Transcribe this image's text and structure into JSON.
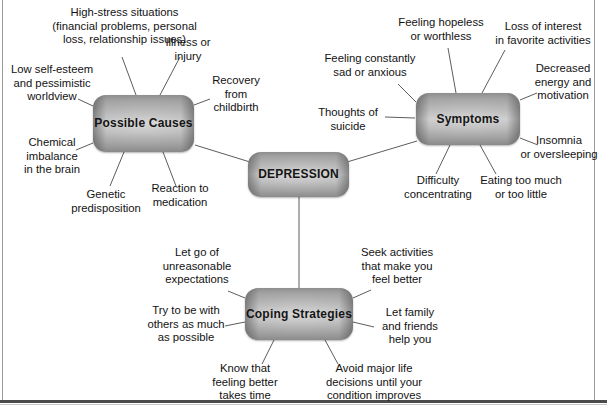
{
  "diagram": {
    "title": "DEPRESSION",
    "type": "mind-map",
    "center": {
      "id": "depression",
      "label": "DEPRESSION"
    },
    "branches": [
      {
        "id": "possible-causes",
        "label": "Possible\nCauses",
        "leaves": [
          {
            "id": "high-stress-situations",
            "text": "High-stress situations\n(financial problems, personal\nloss, relationship issues)"
          },
          {
            "id": "illness-or-injury",
            "text": "Illness or\ninjury"
          },
          {
            "id": "recovery-from-childbirth",
            "text": "Recovery\nfrom\nchildbirth"
          },
          {
            "id": "low-self-esteem",
            "text": "Low self-esteem\nand pessimistic\nworldview"
          },
          {
            "id": "chemical-imbalance",
            "text": "Chemical\nimbalance\nin the brain"
          },
          {
            "id": "genetic-predisposition",
            "text": "Genetic\npredisposition"
          },
          {
            "id": "reaction-to-medication",
            "text": "Reaction to\nmedication"
          }
        ]
      },
      {
        "id": "symptoms",
        "label": "Symptoms",
        "leaves": [
          {
            "id": "feeling-hopeless",
            "text": "Feeling hopeless\nor worthless"
          },
          {
            "id": "loss-of-interest",
            "text": "Loss of interest\nin favorite activities"
          },
          {
            "id": "feeling-sad-anxious",
            "text": "Feeling constantly\nsad or anxious"
          },
          {
            "id": "decreased-energy",
            "text": "Decreased\nenergy and\nmotivation"
          },
          {
            "id": "thoughts-of-suicide",
            "text": "Thoughts of\nsuicide"
          },
          {
            "id": "insomnia-oversleeping",
            "text": "Insomnia\nor oversleeping"
          },
          {
            "id": "difficulty-concentrating",
            "text": "Difficulty\nconcentrating"
          },
          {
            "id": "eating-too-much-or-little",
            "text": "Eating too much\nor too little"
          }
        ]
      },
      {
        "id": "coping-strategies",
        "label": "Coping\nStrategies",
        "leaves": [
          {
            "id": "let-go-expectations",
            "text": "Let go of\nunreasonable\nexpectations"
          },
          {
            "id": "seek-activities",
            "text": "Seek activities\nthat make you\nfeel better"
          },
          {
            "id": "be-with-others",
            "text": "Try to be with\nothers as much\nas possible"
          },
          {
            "id": "let-family-help",
            "text": "Let family\nand friends\nhelp you"
          },
          {
            "id": "know-feeling-better",
            "text": "Know that\nfeeling better\ntakes time"
          },
          {
            "id": "avoid-major-decisions",
            "text": "Avoid major life\ndecisions until your\ncondition improves"
          }
        ]
      }
    ],
    "colors": {
      "node_light": "#d7d7d7",
      "node_dark": "#8a8a8a",
      "connector": "#5d5d5d",
      "text": "#121212",
      "background": "#ffffff",
      "frame_rule": "#4a4a4a"
    }
  }
}
